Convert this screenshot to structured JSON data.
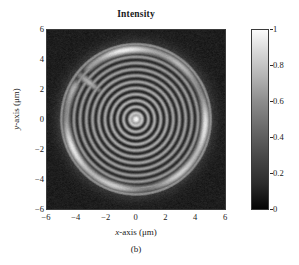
{
  "figure": {
    "title": "Intensity",
    "caption": "(b)"
  },
  "axes": {
    "x": {
      "label_prefix": "x",
      "label_suffix": "-axis (μm)",
      "ticks": [
        "−6",
        "−4",
        "−2",
        "0",
        "2",
        "4",
        "6"
      ],
      "tick_values": [
        -6,
        -4,
        -2,
        0,
        2,
        4,
        6
      ],
      "range": [
        -6,
        6
      ]
    },
    "y": {
      "label_prefix": "y",
      "label_suffix": "-axis (μm)",
      "ticks": [
        "6",
        "4",
        "2",
        "0",
        "−2",
        "−4",
        "−6"
      ],
      "tick_values": [
        6,
        4,
        2,
        0,
        -2,
        -4,
        -6
      ],
      "range": [
        -6,
        6
      ]
    }
  },
  "colorbar": {
    "ticks": [
      "1",
      "0.8",
      "0.6",
      "0.4",
      "0.2",
      "0"
    ],
    "tick_values": [
      1,
      0.8,
      0.6,
      0.4,
      0.2,
      0
    ],
    "range": [
      0,
      1
    ],
    "colormap": "grayscale",
    "low_color": "#050505",
    "high_color": "#fbfbfb",
    "orientation": "vertical",
    "position": "right"
  },
  "chart_data": {
    "type": "heatmap",
    "title": "Intensity",
    "xlabel": "x-axis (μm)",
    "ylabel": "y-axis (μm)",
    "xlim": [
      -6,
      6
    ],
    "ylim": [
      -6,
      6
    ],
    "zlim": [
      0,
      1
    ],
    "colormap": "gray",
    "grid": false,
    "legend": null,
    "pattern": {
      "center": [
        0,
        0
      ],
      "bright_core_radius": 0.45,
      "ring_period_um": 0.42,
      "n_rings": 22,
      "outer_bright_ring_radius": 4.7,
      "outer_bright_ring_width": 0.45,
      "outer_bright_ring_peak": 0.85,
      "background_level": 0.1,
      "background_noise": 0.045,
      "core_peak": 1.0,
      "interior_mean": 0.42,
      "interior_contrast": 0.3,
      "defect_spoke": {
        "angle_deg": 142,
        "inner_radius": 3.0,
        "outer_radius": 5.1,
        "brightness": 0.7
      }
    },
    "radial_profile": {
      "r_um": [
        0,
        0.2,
        0.4,
        0.6,
        0.85,
        1.1,
        1.3,
        1.5,
        1.75,
        2.0,
        2.2,
        2.4,
        2.65,
        2.9,
        3.1,
        3.3,
        3.55,
        3.8,
        4.0,
        4.2,
        4.45,
        4.7,
        4.9,
        5.2,
        5.6,
        6.0
      ],
      "intensity": [
        1.0,
        0.92,
        0.55,
        0.2,
        0.62,
        0.22,
        0.6,
        0.2,
        0.58,
        0.2,
        0.56,
        0.2,
        0.55,
        0.2,
        0.54,
        0.2,
        0.53,
        0.2,
        0.52,
        0.22,
        0.45,
        0.85,
        0.35,
        0.12,
        0.1,
        0.1
      ]
    }
  }
}
